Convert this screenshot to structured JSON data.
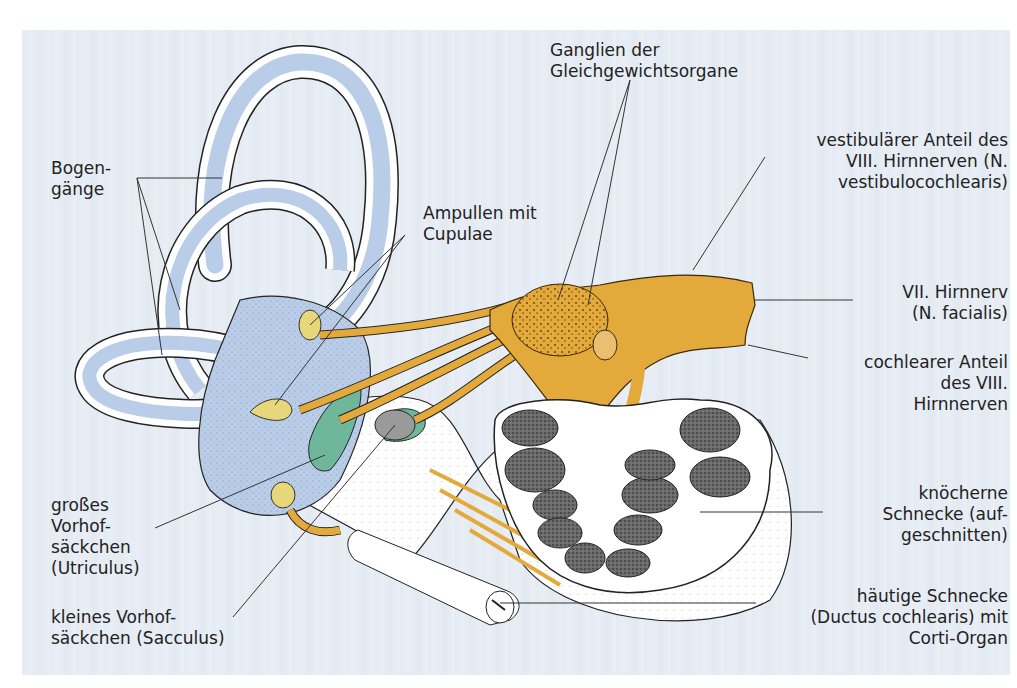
{
  "figure": {
    "colors": {
      "background": "#e6ecf4",
      "endolymph_blue": "#b9cde8",
      "nerve_yellow": "#e3a93a",
      "macula_green": "#6fb79a",
      "cochlea_dark": "#5a5a5a",
      "bone_white": "#ffffff",
      "cupula_yellow": "#e8d77a"
    }
  },
  "labels": {
    "bogengaenge": "Bogen-\ngänge",
    "ampullen": "Ampullen mit\nCupulae",
    "ganglien": "Ganglien der\nGleichgewichtsorgane",
    "vestibular": "vestibulärer Anteil des\nVIII. Hirnnerven (N.\nvestibulocochlearis)",
    "facialis": "VII. Hirnnerv\n(N. facialis)",
    "cochlear": "cochlearer Anteil\ndes VIII.\nHirnnerven",
    "utriculus": "großes\nVorhof-\nsäckchen\n(Utriculus)",
    "sacculus": "kleines Vorhof-\nsäckchen (Sacculus)",
    "knoecherne": "knöcherne\nSchnecke (auf-\ngeschnitten)",
    "haeutige": "häutige Schnecke\n(Ductus cochlearis) mit\nCorti-Organ"
  }
}
